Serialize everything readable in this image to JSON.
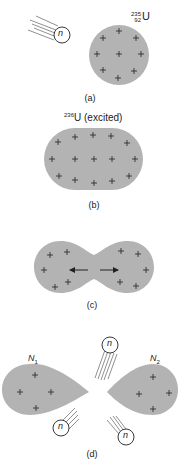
{
  "colors": {
    "nucleus_fill": "#b3b3b3",
    "stroke": "#222222",
    "background": "#ffffff"
  },
  "panels": {
    "a": {
      "caption": "(a)",
      "isotope": {
        "mass": "235",
        "atomic": "92",
        "symbol": "U"
      },
      "neutron_label": "n"
    },
    "b": {
      "caption": "(b)",
      "isotope": {
        "mass": "236",
        "symbol": "U",
        "state": " (excited)"
      }
    },
    "c": {
      "caption": "(c)"
    },
    "d": {
      "caption": "(d)",
      "fragment_1": {
        "base": "N",
        "sub": "1"
      },
      "fragment_2": {
        "base": "N",
        "sub": "2"
      },
      "neutron_label": "n"
    }
  },
  "symbols": {
    "charge": "+",
    "neutron": "n"
  }
}
